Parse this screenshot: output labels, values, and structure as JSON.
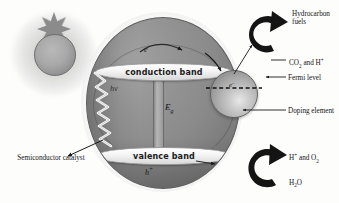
{
  "diagram": {
    "type": "scientific-schematic",
    "sun": {
      "name": "sun",
      "rays": 8,
      "color": "#8b8b8b"
    },
    "sphere": {
      "name": "semiconductor-catalyst-particle",
      "color": "#8a8a8a",
      "bands": [
        {
          "id": "conduction",
          "label": "conduction band"
        },
        {
          "id": "valence",
          "label": "valence band"
        }
      ],
      "band_gap_symbol": "E",
      "band_gap_subscript": "g",
      "photon_symbol": "hv",
      "electron_symbol": "e",
      "electron_superscript": "–",
      "hole_symbol": "h",
      "hole_superscript": "+"
    },
    "dopant": {
      "name": "doping-element-sphere",
      "electron_symbol": "e",
      "electron_superscript": "–",
      "fermi_line_style": "dashed"
    },
    "callouts": {
      "hydrocarbon_fuels": "Hydrocarbon fuels",
      "co2_and_h": "CO₂ and H⁺",
      "fermi_level": "Fermi level",
      "doping_element": "Doping element",
      "h_and_o2": "H⁺ and O₂",
      "h2o": "H₂O",
      "semiconductor_catalyst": "Semiconductor catalyst"
    },
    "colors": {
      "sphere": "#8a8a8a",
      "band_fill": "#ffffff",
      "arrow": "#1a1a1a",
      "text": "#141414",
      "background": "#fdfdfc"
    }
  }
}
